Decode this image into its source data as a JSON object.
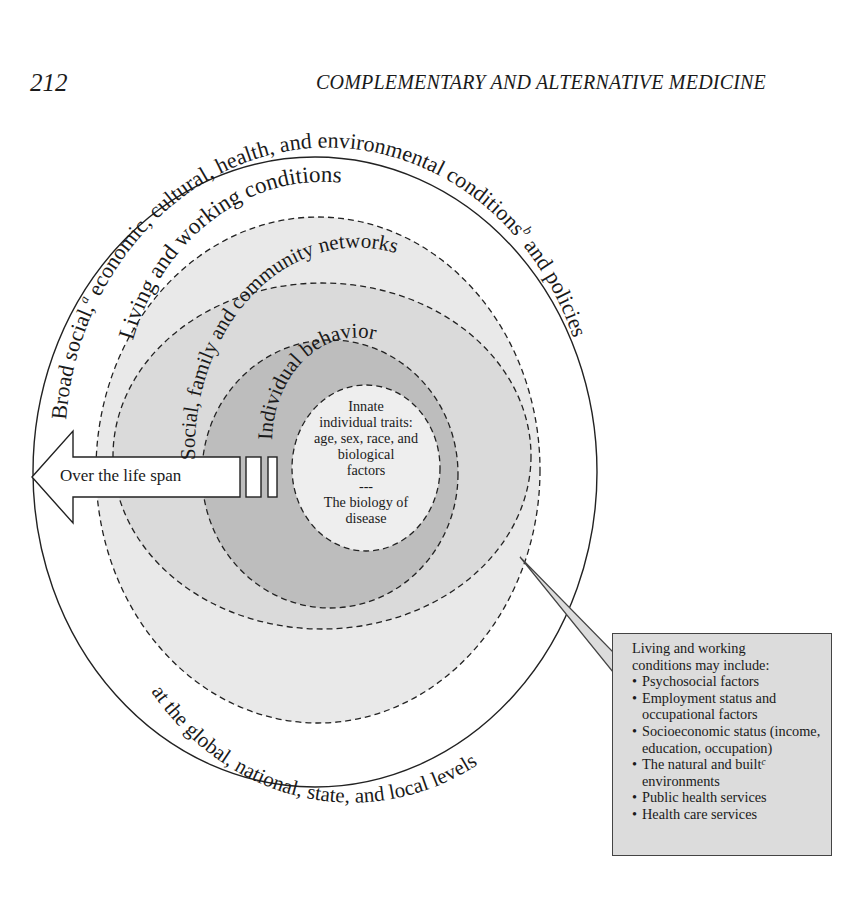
{
  "header": {
    "page_number": "212",
    "running_head": "COMPLEMENTARY AND ALTERNATIVE MEDICINE"
  },
  "diagram": {
    "outer_ring": {
      "label_top": "Broad social,",
      "label_top_sup": "a",
      "label_top_rest": " economic, cultural, health, and environmental conditions",
      "label_top_sup2": "b",
      "label_right": " and policies",
      "label_bottom": "at the global, national, state, and local levels"
    },
    "rings": [
      {
        "label": "Living and working conditions",
        "fill": "#e9e9e9"
      },
      {
        "label": "Social, family and community networks",
        "fill": "#dadada"
      },
      {
        "label": "Individual behavior",
        "fill": "#bdbdbd"
      }
    ],
    "center": {
      "lines": [
        "Innate",
        "individual traits:",
        "age, sex, race, and",
        "biological",
        "factors",
        "---",
        "The biology of",
        "disease"
      ],
      "fill": "#eeeeee"
    },
    "arrow": {
      "label": "Over the life span"
    },
    "callout": {
      "title_lines": [
        "Living and working",
        "conditions may include:"
      ],
      "items": [
        {
          "text": "Psychosocial factors"
        },
        {
          "text": "Employment status and occupational factors"
        },
        {
          "text": "Socioeconomic status (income, education, occupation)"
        },
        {
          "text": "The natural and built",
          "sup": "c",
          "after": " environments"
        },
        {
          "text": "Public health services"
        },
        {
          "text": "Health care services"
        }
      ],
      "fill": "#dcdcdc"
    }
  },
  "colors": {
    "outer_fill": "#ffffff",
    "stroke": "#222222"
  }
}
